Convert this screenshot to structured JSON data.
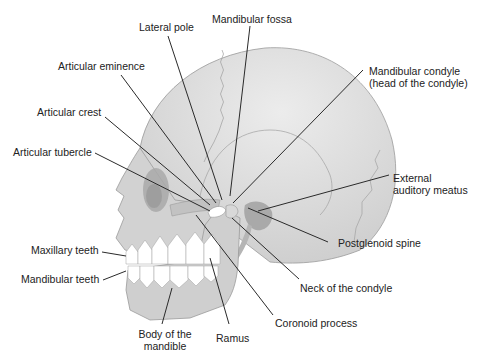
{
  "figure": {
    "colors": {
      "background": "#ffffff",
      "bone_fill": "#d4d4d4",
      "cranium_highlight": "#e6e6e6",
      "bone_outline": "#9a9a9a",
      "shadow": "#a8a8a8",
      "teeth": "#ffffff",
      "leader_line": "#2a2a2a",
      "label_text": "#222222"
    }
  },
  "labels": {
    "lateral_pole": "Lateral pole",
    "mandibular_fossa": "Mandibular fossa",
    "articular_eminence": "Articular eminence",
    "mandibular_condyle_line1": "Mandibular condyle",
    "mandibular_condyle_line2": "(head of the condyle)",
    "articular_crest": "Articular crest",
    "articular_tubercle": "Articular tubercle",
    "external_auditory_meatus_line1": "External",
    "external_auditory_meatus_line2": "auditory meatus",
    "postglenoid_spine": "Postglenoid spine",
    "maxillary_teeth": "Maxillary teeth",
    "mandibular_teeth": "Mandibular teeth",
    "neck_of_condyle": "Neck of the condyle",
    "body_of_mandible_line1": "Body of the",
    "body_of_mandible_line2": "mandible",
    "ramus": "Ramus",
    "coronoid_process": "Coronoid process"
  }
}
